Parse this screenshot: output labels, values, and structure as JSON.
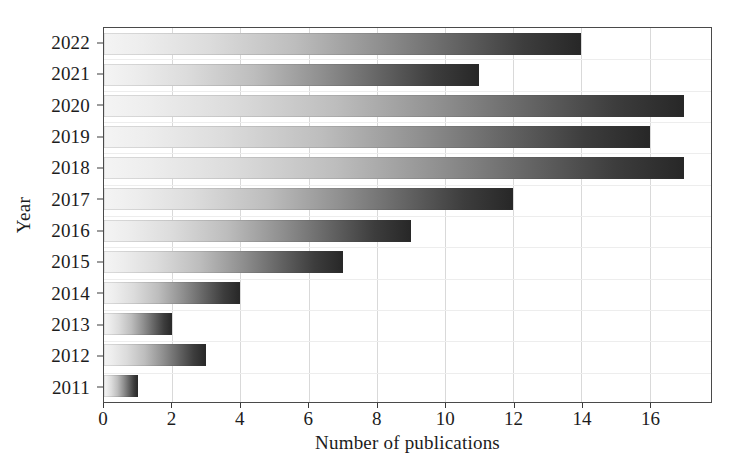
{
  "chart_data": {
    "type": "bar",
    "orientation": "horizontal",
    "title": "",
    "xlabel": "Number of publications",
    "ylabel": "Year",
    "categories": [
      "2022",
      "2021",
      "2020",
      "2019",
      "2018",
      "2017",
      "2016",
      "2015",
      "2014",
      "2013",
      "2012",
      "2011"
    ],
    "values": [
      14,
      11,
      17,
      16,
      17,
      12,
      9,
      7,
      4,
      2,
      3,
      1
    ],
    "xlim": [
      0,
      17.8
    ],
    "xticks": [
      0,
      2,
      4,
      6,
      8,
      10,
      12,
      14,
      16
    ],
    "xticklabels": [
      "0",
      "2",
      "4",
      "6",
      "8",
      "10",
      "12",
      "14",
      "16"
    ],
    "grid": true,
    "legend": null,
    "bar_gradient": {
      "from": "#f4f4f4",
      "to": "#272727",
      "direction": "left-to-right"
    },
    "colors": {
      "axis": "#3a3a3a",
      "frame": "#4a4a4a",
      "grid": "#d9d9d9",
      "text": "#1c1c1c",
      "background": "#ffffff"
    }
  }
}
